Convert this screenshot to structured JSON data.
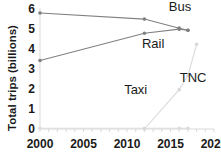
{
  "chart_data": {
    "type": "line",
    "title": "",
    "xlabel": "",
    "ylabel": "Total trips (billions)",
    "xlim": [
      2000,
      2020
    ],
    "ylim": [
      0,
      6
    ],
    "grid": false,
    "legend": "inline-labels",
    "x_ticks": [
      "2000",
      "2005",
      "2010",
      "2015",
      "2020"
    ],
    "x_tick_values": [
      2000,
      2005,
      2010,
      2015,
      2020
    ],
    "y_ticks": [
      "0",
      "1",
      "2",
      "3",
      "4",
      "5",
      "6"
    ],
    "y_tick_values": [
      0,
      1,
      2,
      3,
      4,
      5,
      6
    ],
    "series": [
      {
        "name": "Bus",
        "color": "#808080",
        "x": [
          2000,
          2012,
          2016,
          2017
        ],
        "values": [
          5.75,
          5.45,
          5.0,
          4.9
        ],
        "label_x": 2016.1,
        "label_y": 5.85
      },
      {
        "name": "Rail",
        "color": "#808080",
        "x": [
          2000,
          2012,
          2016,
          2017
        ],
        "values": [
          3.4,
          4.75,
          4.95,
          4.9
        ],
        "label_x": 2013.0,
        "label_y": 4.0
      },
      {
        "name": "Taxi",
        "color": "#dcdcdc",
        "x": [
          2000,
          2012,
          2016,
          2017
        ],
        "values": [
          0.04,
          0.04,
          0.04,
          0.04
        ],
        "label_x": 2011.0,
        "label_y": 1.75
      },
      {
        "name": "TNC",
        "color": "#d9d9d9",
        "x": [
          2012,
          2016,
          2017,
          2018
        ],
        "values": [
          0.0,
          1.95,
          2.65,
          4.2
        ],
        "label_x": 2017.6,
        "label_y": 2.35
      }
    ]
  },
  "axes": {
    "y_title": "Total trips (billions)",
    "axis_color": "#d9d9d9"
  }
}
